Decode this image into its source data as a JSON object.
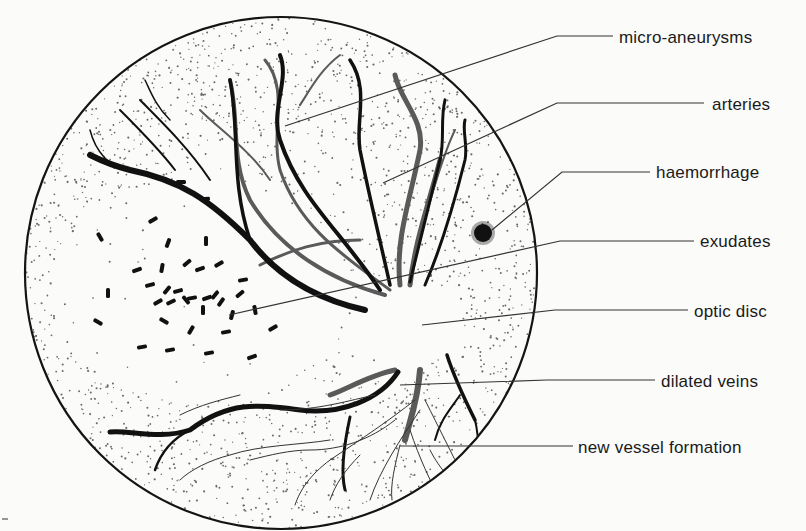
{
  "colors": {
    "background": "#fbfbfa",
    "ink": "#141414",
    "vein": "#111111",
    "artery": "#555555",
    "stipple": "#6a6a6a",
    "leader": "#333333"
  },
  "fundus": {
    "cx": 281,
    "cy": 273,
    "r": 256
  },
  "labels": [
    {
      "id": "micro-aneurysms",
      "text": "micro-aneurysms",
      "x": 619,
      "y": 28,
      "line": [
        [
          613,
          36
        ],
        [
          557,
          36
        ],
        [
          285,
          126
        ]
      ]
    },
    {
      "id": "arteries",
      "text": "arteries",
      "x": 712,
      "y": 95,
      "line": [
        [
          704,
          103
        ],
        [
          557,
          103
        ],
        [
          383,
          183
        ]
      ]
    },
    {
      "id": "haemorrhage",
      "text": "haemorrhage",
      "x": 656,
      "y": 163,
      "line": [
        [
          650,
          172
        ],
        [
          562,
          172
        ],
        [
          492,
          230
        ]
      ]
    },
    {
      "id": "exudates",
      "text": "exudates",
      "x": 700,
      "y": 232,
      "line": [
        [
          694,
          241
        ],
        [
          560,
          241
        ],
        [
          229,
          315
        ]
      ]
    },
    {
      "id": "optic-disc",
      "text": "optic disc",
      "x": 694,
      "y": 302,
      "line": [
        [
          688,
          310
        ],
        [
          555,
          310
        ],
        [
          422,
          325
        ]
      ]
    },
    {
      "id": "dilated-veins",
      "text": "dilated veins",
      "x": 661,
      "y": 372,
      "line": [
        [
          655,
          380
        ],
        [
          547,
          380
        ],
        [
          400,
          385
        ]
      ]
    },
    {
      "id": "new-vessel-formation",
      "text": "new vessel formation",
      "x": 578,
      "y": 438,
      "line": [
        [
          573,
          446
        ],
        [
          540,
          446
        ],
        [
          400,
          446
        ]
      ]
    }
  ]
}
